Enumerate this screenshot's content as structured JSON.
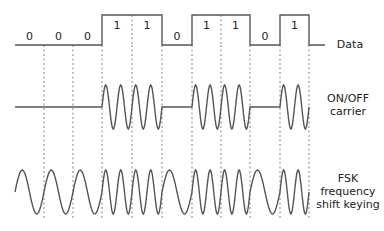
{
  "diagram": {
    "bits": [
      0,
      0,
      0,
      1,
      1,
      0,
      1,
      1,
      0,
      1
    ],
    "bit_labels": [
      "0",
      "0",
      "0",
      "1",
      "1",
      "0",
      "1",
      "1",
      "0",
      "1"
    ],
    "boundaries_x": [
      15,
      44,
      73,
      102,
      132,
      162,
      192,
      221,
      250,
      280,
      309
    ],
    "data_tail_end_x": 325,
    "data_low_y": 45,
    "data_high_y": 15,
    "carrier_center_y": 107,
    "fsk_center_y": 192,
    "amplitude": 22,
    "cycles_per_one_bit": 2,
    "cycles_per_zero_bit_fsk": 1,
    "line_color": "#555555"
  },
  "labels": {
    "data": "Data",
    "onoff_line1": "ON/OFF",
    "onoff_line2": "carrier",
    "fsk_line1": "FSK",
    "fsk_line2": "frequency",
    "fsk_line3": "shift keying"
  }
}
